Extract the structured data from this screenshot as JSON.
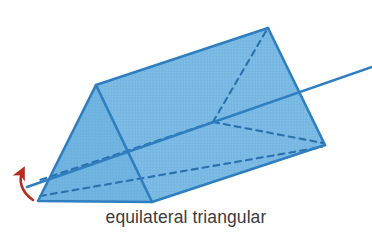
{
  "figure": {
    "caption": "equilateral triangular",
    "shape_name": "equilateral triangular prism",
    "caption_color": "#3b3b3d",
    "background_color": "#ffffff"
  },
  "colors": {
    "face_fill": "#6fb3e0",
    "face_fill_light": "#7cbce6",
    "edge_stroke": "#2f7ec0",
    "hidden_edge_stroke": "#2a6fae",
    "axis_stroke": "#2f7ec0",
    "arrow_red": "#b32d21"
  },
  "geometry": {
    "front_face_label": "front triangular face",
    "top_face_label": "top rectangular face",
    "bottom_face_label": "bottom rectangular face",
    "front_apex": [
      96,
      85
    ],
    "front_bottom_left": [
      38,
      201
    ],
    "front_bottom_right": [
      152,
      202
    ],
    "back_apex": [
      268,
      28
    ],
    "back_bottom_right": [
      325,
      145
    ],
    "hidden_back_vertex": [
      213,
      122
    ],
    "axis_start": [
      27,
      187
    ],
    "axis_end": [
      372,
      67
    ]
  },
  "annotations": {
    "axis_of_rotation_label": "axis of rotation",
    "rotation_arrow_label": "rotation direction arrow"
  }
}
